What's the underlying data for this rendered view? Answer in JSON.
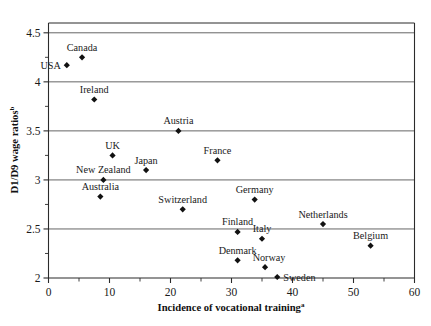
{
  "chart_data": {
    "type": "scatter",
    "title": "",
    "xlabel": "Incidence of vocational training",
    "xlabel_superscript": "a",
    "ylabel": "D1/D9 wage ratios",
    "ylabel_superscript": "b",
    "xlim": [
      0,
      60
    ],
    "ylim": [
      2,
      4.6
    ],
    "xticks": [
      0,
      10,
      20,
      30,
      40,
      50,
      60
    ],
    "xtick_labels": [
      "0",
      "10",
      "20",
      "30",
      "40",
      "50",
      "60"
    ],
    "yticks": [
      2,
      2.5,
      3,
      3.5,
      4,
      4.5
    ],
    "ytick_labels": [
      "2",
      "2.5",
      "3",
      "3.5",
      "4",
      "4.5"
    ],
    "y_minor_ticks": [
      2.25,
      2.75,
      3.25,
      3.75,
      4.25
    ],
    "x_minor_ticks": [
      5,
      15,
      25,
      35,
      45,
      55
    ],
    "grid": "horizontal",
    "gridlines_at": [
      2.5,
      3,
      3.5,
      4,
      4.5
    ],
    "legend": "none",
    "marker_color": "#111111",
    "marker_shape": "diamond",
    "points": [
      {
        "label": "USA",
        "x": 3.0,
        "y": 4.17,
        "label_pos": "left"
      },
      {
        "label": "Canada",
        "x": 5.5,
        "y": 4.25,
        "label_pos": "above"
      },
      {
        "label": "Ireland",
        "x": 7.5,
        "y": 3.82,
        "label_pos": "above"
      },
      {
        "label": "Austria",
        "x": 21.3,
        "y": 3.5,
        "label_pos": "above"
      },
      {
        "label": "UK",
        "x": 10.5,
        "y": 3.25,
        "label_pos": "above"
      },
      {
        "label": "France",
        "x": 27.7,
        "y": 3.2,
        "label_pos": "above"
      },
      {
        "label": "Japan",
        "x": 16.0,
        "y": 3.1,
        "label_pos": "above"
      },
      {
        "label": "New Zealand",
        "x": 9.0,
        "y": 3.0,
        "label_pos": "above"
      },
      {
        "label": "Australia",
        "x": 8.5,
        "y": 2.83,
        "label_pos": "above"
      },
      {
        "label": "Germany",
        "x": 33.8,
        "y": 2.8,
        "label_pos": "above"
      },
      {
        "label": "Switzerland",
        "x": 22.0,
        "y": 2.7,
        "label_pos": "above"
      },
      {
        "label": "Netherlands",
        "x": 45.0,
        "y": 2.55,
        "label_pos": "above"
      },
      {
        "label": "Finland",
        "x": 31.0,
        "y": 2.47,
        "label_pos": "above"
      },
      {
        "label": "Italy",
        "x": 35.0,
        "y": 2.4,
        "label_pos": "above"
      },
      {
        "label": "Belgium",
        "x": 52.8,
        "y": 2.33,
        "label_pos": "above"
      },
      {
        "label": "Denmark",
        "x": 31.0,
        "y": 2.18,
        "label_pos": "above"
      },
      {
        "label": "Norway",
        "x": 35.5,
        "y": 2.11,
        "label_pos": "above-right"
      },
      {
        "label": "Sweden",
        "x": 37.5,
        "y": 2.01,
        "label_pos": "right"
      }
    ]
  }
}
